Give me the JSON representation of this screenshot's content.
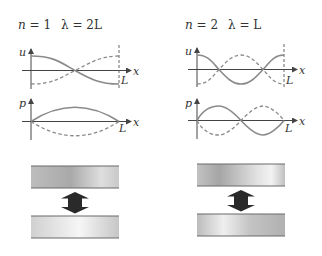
{
  "panels": [
    {
      "id": "mode-1",
      "title": {
        "n_label": "n",
        "n_eq": " = 1",
        "lambda_label": "λ",
        "lambda_eq": " = 2L"
      },
      "displacement_plot": {
        "y_label": "u",
        "x_label": "x",
        "end_label": "L"
      },
      "pressure_plot": {
        "y_label": "p",
        "x_label": "x",
        "end_label": "L"
      },
      "plates": {
        "top": "plate",
        "bottom": "plate",
        "arrow": "double-arrow"
      }
    },
    {
      "id": "mode-2",
      "title": {
        "n_label": "n",
        "n_eq": " = 2",
        "lambda_label": "λ",
        "lambda_eq": " = L"
      },
      "displacement_plot": {
        "y_label": "u",
        "x_label": "x",
        "end_label": "L"
      },
      "pressure_plot": {
        "y_label": "p",
        "x_label": "x",
        "end_label": "L"
      },
      "plates": {
        "top": "plate",
        "bottom": "plate",
        "arrow": "double-arrow"
      }
    }
  ],
  "colors": {
    "curve": "#8a8a8a",
    "axis": "#444444",
    "arrow": "#2a2a2a",
    "plate_light": "#f4f4f4",
    "plate_dark": "#a8a8a8"
  }
}
